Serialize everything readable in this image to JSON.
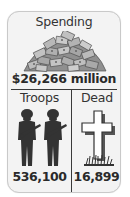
{
  "spending": {
    "title": "Spending",
    "value": "$26,266 million",
    "icon": "money-pile-icon"
  },
  "troops": {
    "label": "Troops",
    "value": "536,100",
    "icon": "soldiers-icon"
  },
  "dead": {
    "label": "Dead",
    "value": "16,899",
    "icon": "grave-cross-icon"
  },
  "colors": {
    "card_background": "#f3f3f3",
    "card_border": "#c9c9c9",
    "text": "#2a2a2a",
    "icon_dark": "#3a3a3a",
    "money_gray": "#8a8a8a"
  }
}
